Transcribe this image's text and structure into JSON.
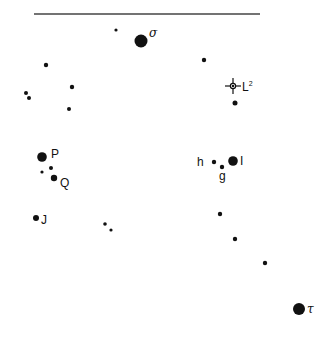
{
  "chart_data": {
    "type": "scatter",
    "title": "",
    "colors": {
      "star": "#111111",
      "line": "#444444",
      "background": "#ffffff"
    },
    "horizon_line": {
      "x1": 34,
      "x2": 260,
      "y": 14
    },
    "stars": [
      {
        "id": "s1",
        "x": 116,
        "y": 30,
        "r": 1.6,
        "label": ""
      },
      {
        "id": "sigma",
        "x": 141,
        "y": 41,
        "r": 6.5,
        "label": "σ",
        "label_x": 149,
        "label_y": 37,
        "label_style": "greek"
      },
      {
        "id": "s3",
        "x": 46,
        "y": 65,
        "r": 2.2,
        "label": ""
      },
      {
        "id": "s4",
        "x": 204,
        "y": 60,
        "r": 2.2,
        "label": ""
      },
      {
        "id": "s5",
        "x": 26,
        "y": 93,
        "r": 2.0,
        "label": ""
      },
      {
        "id": "s6",
        "x": 29,
        "y": 98,
        "r": 2.0,
        "label": ""
      },
      {
        "id": "s7",
        "x": 72,
        "y": 87,
        "r": 2.2,
        "label": ""
      },
      {
        "id": "s8",
        "x": 69,
        "y": 109,
        "r": 2.0,
        "label": ""
      },
      {
        "id": "s9",
        "x": 235,
        "y": 103,
        "r": 2.5,
        "label": ""
      },
      {
        "id": "P",
        "x": 42,
        "y": 157,
        "r": 4.8,
        "label": "P",
        "label_x": 51,
        "label_y": 158,
        "label_style": "lbl"
      },
      {
        "id": "s11",
        "x": 51,
        "y": 168,
        "r": 2.0,
        "label": ""
      },
      {
        "id": "s12",
        "x": 42,
        "y": 172,
        "r": 1.6,
        "label": ""
      },
      {
        "id": "Q",
        "x": 54,
        "y": 178,
        "r": 3.2,
        "label": "Q",
        "label_x": 60,
        "label_y": 187,
        "label_style": "lbl"
      },
      {
        "id": "h",
        "x": 214,
        "y": 162,
        "r": 2.2,
        "label": "h",
        "label_x": 197,
        "label_y": 166,
        "label_style": "lbl"
      },
      {
        "id": "I",
        "x": 233,
        "y": 161,
        "r": 4.8,
        "label": "I",
        "label_x": 240,
        "label_y": 165,
        "label_style": "lbl"
      },
      {
        "id": "g",
        "x": 222,
        "y": 167,
        "r": 2.2,
        "label": "g",
        "label_x": 219,
        "label_y": 180,
        "label_style": "lbl"
      },
      {
        "id": "J",
        "x": 36,
        "y": 218,
        "r": 3.0,
        "label": "J",
        "label_x": 41,
        "label_y": 224,
        "label_style": "lbl"
      },
      {
        "id": "s18",
        "x": 105,
        "y": 224,
        "r": 1.8,
        "label": ""
      },
      {
        "id": "s19",
        "x": 111,
        "y": 230,
        "r": 1.6,
        "label": ""
      },
      {
        "id": "s20",
        "x": 220,
        "y": 214,
        "r": 2.2,
        "label": ""
      },
      {
        "id": "s21",
        "x": 235,
        "y": 239,
        "r": 2.2,
        "label": ""
      },
      {
        "id": "s22",
        "x": 265,
        "y": 263,
        "r": 2.2,
        "label": ""
      },
      {
        "id": "tau",
        "x": 299,
        "y": 309,
        "r": 6.0,
        "label": "τ",
        "label_x": 307,
        "label_y": 313,
        "label_style": "greek"
      }
    ],
    "markers": [
      {
        "id": "L2",
        "type": "crosshair",
        "x": 233,
        "y": 86,
        "label": "L",
        "superscript": "2",
        "label_x": 242,
        "label_y": 91
      }
    ]
  }
}
